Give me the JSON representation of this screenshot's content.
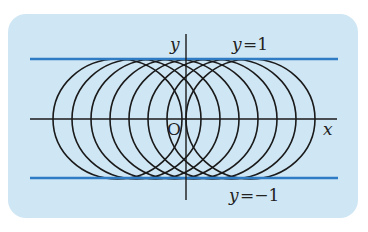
{
  "diagram": {
    "colors": {
      "panel_bg": "#cfe6f4",
      "boundary_line": "#2f7cc4",
      "curve": "#1a1a1a",
      "axis": "#1a1a1a"
    },
    "axes": {
      "x_label": "x",
      "y_label": "y",
      "origin_label": "O"
    },
    "boundary_lines": [
      {
        "label": "y=1",
        "y_value": 1
      },
      {
        "label": "y=−1",
        "y_value": -1
      }
    ],
    "label_parts": {
      "top_var": "y",
      "top_eq": "=1",
      "bottom_var": "y",
      "bottom_eq": "=−1"
    },
    "circles": {
      "count": 8,
      "radius": 1,
      "centers_on": "x-axis",
      "description": "Unit circles centered on the x-axis, each tangent to y=1 and y=−1"
    }
  }
}
